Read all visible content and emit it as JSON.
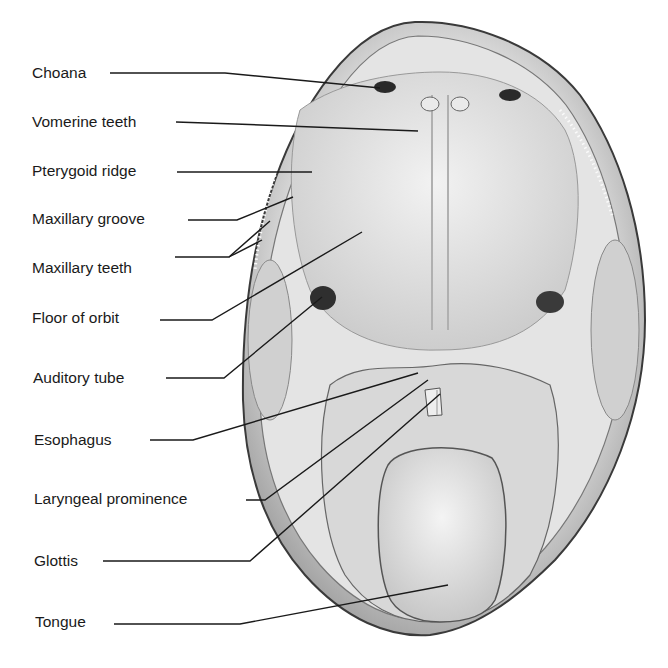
{
  "figure": {
    "labels": [
      {
        "id": "choana",
        "text": "Choana",
        "x": 32,
        "y": 64
      },
      {
        "id": "vomerine-teeth",
        "text": "Vomerine teeth",
        "x": 32,
        "y": 113
      },
      {
        "id": "pterygoid-ridge",
        "text": "Pterygoid ridge",
        "x": 32,
        "y": 162
      },
      {
        "id": "maxillary-groove",
        "text": "Maxillary groove",
        "x": 32,
        "y": 210
      },
      {
        "id": "maxillary-teeth",
        "text": "Maxillary teeth",
        "x": 32,
        "y": 259
      },
      {
        "id": "floor-of-orbit",
        "text": "Floor of orbit",
        "x": 32,
        "y": 307
      },
      {
        "id": "auditory-tube",
        "text": "Auditory tube",
        "x": 32,
        "y": 370
      },
      {
        "id": "esophagus",
        "text": "Esophagus",
        "x": 32,
        "y": 432
      },
      {
        "id": "laryngeal-prominence",
        "text": "Laryngeal prominence",
        "x": 32,
        "y": 489
      },
      {
        "id": "glottis",
        "text": "Glottis",
        "x": 32,
        "y": 551
      },
      {
        "id": "tongue",
        "text": "Tongue",
        "x": 32,
        "y": 613
      }
    ]
  }
}
